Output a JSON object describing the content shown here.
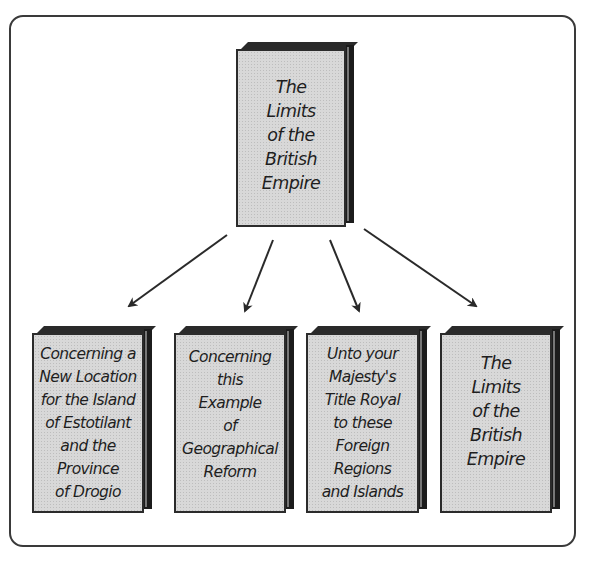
{
  "diagram": {
    "type": "hierarchy",
    "root": {
      "title": "The\nLimits\nof the\nBritish\nEmpire"
    },
    "children": [
      {
        "title": "Concerning a\nNew Location\nfor the Island\nof Estotilant\nand the\nProvince\nof Drogio"
      },
      {
        "title": "Concerning\nthis\nExample\nof\nGeographical\nReform"
      },
      {
        "title": "Unto your\nMajesty's\nTitle Royal\nto these\nForeign\nRegions\nand Islands"
      },
      {
        "title": "The\nLimits\nof the\nBritish\nEmpire"
      }
    ],
    "colors": {
      "frame": "#3a3a3a",
      "book_face": "#d8d8d8",
      "book_spine": "#1c1c1c",
      "arrow": "#2a2a2a"
    }
  }
}
